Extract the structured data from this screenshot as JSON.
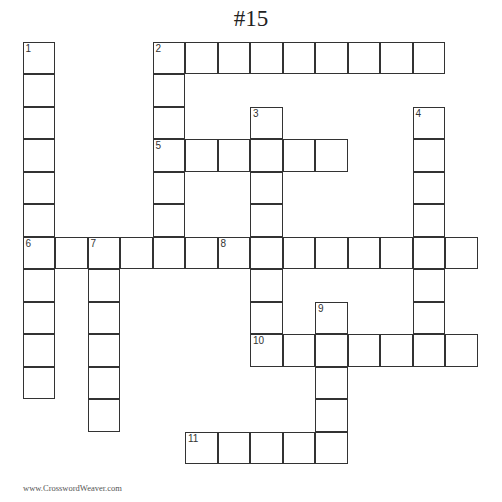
{
  "title": "#15",
  "footer": "www.CrosswordWeaver.com",
  "cell_size": 32.5,
  "entries": [
    {
      "num": 1,
      "dir": "down",
      "col": 0,
      "row": 0,
      "len": 11
    },
    {
      "num": 2,
      "dir": "across",
      "col": 4,
      "row": 0,
      "len": 9
    },
    {
      "num": 2,
      "dir": "down",
      "col": 4,
      "row": 0,
      "len": 7
    },
    {
      "num": 3,
      "dir": "down",
      "col": 7,
      "row": 2,
      "len": 7
    },
    {
      "num": 4,
      "dir": "down",
      "col": 12,
      "row": 2,
      "len": 8
    },
    {
      "num": 5,
      "dir": "across",
      "col": 4,
      "row": 3,
      "len": 6
    },
    {
      "num": 6,
      "dir": "across",
      "col": 0,
      "row": 6,
      "len": 6
    },
    {
      "num": 7,
      "dir": "down",
      "col": 2,
      "row": 6,
      "len": 6
    },
    {
      "num": 8,
      "dir": "across",
      "col": 6,
      "row": 6,
      "len": 8
    },
    {
      "num": 9,
      "dir": "down",
      "col": 9,
      "row": 8,
      "len": 5
    },
    {
      "num": 10,
      "dir": "across",
      "col": 7,
      "row": 9,
      "len": 7
    },
    {
      "num": 11,
      "dir": "across",
      "col": 5,
      "row": 12,
      "len": 5
    }
  ]
}
